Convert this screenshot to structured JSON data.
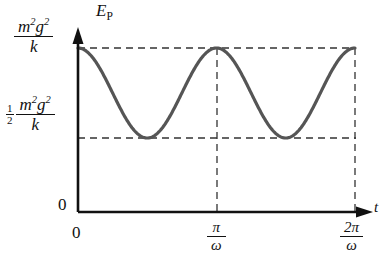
{
  "figure": {
    "name": "potential-energy-vs-time-graph",
    "background_color": "#ffffff",
    "curve_color": "#555555",
    "axis_color": "#111111",
    "dash_color": "#333333"
  },
  "axes": {
    "y_axis_label": "E",
    "y_axis_label_sub": "P",
    "x_axis_label": "t",
    "origin_label_y": "0",
    "origin_label_x": "0"
  },
  "y_ticks": [
    {
      "id": "max",
      "prefix": "",
      "numerator_base1": "m",
      "numerator_sup1": "2",
      "numerator_base2": "g",
      "numerator_sup2": "2",
      "denominator": "k",
      "value": 1.0
    },
    {
      "id": "half",
      "prefix_num": "1",
      "prefix_den": "2",
      "numerator_base1": "m",
      "numerator_sup1": "2",
      "numerator_base2": "g",
      "numerator_sup2": "2",
      "denominator": "k",
      "value": 0.5
    }
  ],
  "x_ticks": [
    {
      "id": "zero",
      "label": "0",
      "value": 0
    },
    {
      "id": "pi_over_omega",
      "numerator": "π",
      "denominator": "ω",
      "value": 1
    },
    {
      "id": "2pi_over_omega",
      "numerator": "2π",
      "denominator": "ω",
      "value": 2
    }
  ],
  "chart_data": {
    "type": "line",
    "title": "",
    "xlabel": "t",
    "ylabel": "E_P",
    "grid": false,
    "legend": false,
    "formula": "E_P = (m^2 g^2 / k) cos^2(omega t)",
    "amplitude_max_label": "m^2 g^2 / k",
    "amplitude_min_label": "(1/2) m^2 g^2 / k",
    "ylim": [
      0,
      1.12
    ],
    "xlim": [
      0,
      2.18
    ],
    "xtick_values": [
      0,
      1,
      2
    ],
    "xtick_labels": [
      "0",
      "pi/omega",
      "2pi/omega"
    ],
    "ytick_values": [
      0.5,
      1.0
    ],
    "ytick_labels": [
      "(1/2) m^2 g^2 / k",
      "m^2 g^2 / k"
    ],
    "period": 1,
    "maxima_x": [
      0,
      1,
      2
    ],
    "minima_x": [
      0.5,
      1.5
    ],
    "series": [
      {
        "name": "E_P(t)",
        "color": "#555555",
        "x": [
          0,
          0.05,
          0.1,
          0.15,
          0.2,
          0.25,
          0.3,
          0.35,
          0.4,
          0.45,
          0.5,
          0.55,
          0.6,
          0.65,
          0.7,
          0.75,
          0.8,
          0.85,
          0.9,
          0.95,
          1.0,
          1.05,
          1.1,
          1.15,
          1.2,
          1.25,
          1.3,
          1.35,
          1.4,
          1.45,
          1.5,
          1.55,
          1.6,
          1.65,
          1.7,
          1.75,
          1.8,
          1.85,
          1.9,
          1.95,
          2.0
        ],
        "y": [
          1.0,
          0.994,
          0.976,
          0.948,
          0.905,
          0.854,
          0.794,
          0.729,
          0.663,
          0.595,
          0.5,
          0.534,
          0.595,
          0.663,
          0.729,
          0.794,
          0.854,
          0.905,
          0.948,
          0.976,
          1.0,
          0.994,
          0.976,
          0.948,
          0.905,
          0.854,
          0.794,
          0.729,
          0.663,
          0.595,
          0.5,
          0.534,
          0.595,
          0.663,
          0.729,
          0.794,
          0.854,
          0.905,
          0.948,
          0.976,
          1.0
        ]
      }
    ],
    "guide_lines": {
      "horizontal": [
        {
          "y_value": 1.0,
          "style": "dashed",
          "from_x": 0,
          "to_x": 2
        },
        {
          "y_value": 0.5,
          "style": "dashed",
          "from_x": 0,
          "to_x": 2
        }
      ],
      "vertical": [
        {
          "x_value": 1,
          "style": "dashed",
          "from_y": 0,
          "to_y": 1.0
        },
        {
          "x_value": 2,
          "style": "dashed",
          "from_y": 0,
          "to_y": 1.0
        }
      ]
    }
  }
}
